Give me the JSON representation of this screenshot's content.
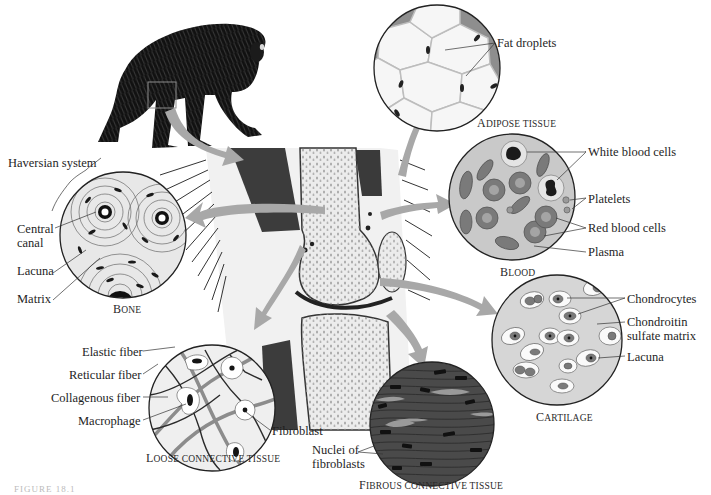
{
  "figure": {
    "caption_partial": "FIGURE 18.1"
  },
  "panels": {
    "bone": {
      "caption": "Bone",
      "labels": [
        "Haversian system",
        "Central canal",
        "Lacuna",
        "Matrix"
      ]
    },
    "adipose": {
      "caption": "Adipose tissue",
      "labels": [
        "Fat droplets"
      ]
    },
    "blood": {
      "caption": "Blood",
      "labels": [
        "White blood cells",
        "Platelets",
        "Red blood cells",
        "Plasma"
      ]
    },
    "cartilage": {
      "caption": "Cartilage",
      "labels": [
        "Chondrocytes",
        "Chondroitin",
        "sulfate matrix",
        "Lacuna"
      ]
    },
    "loose": {
      "caption": "Loose connective tissue",
      "labels": [
        "Elastic fiber",
        "Reticular fiber",
        "Collagenous fiber",
        "Macrophage",
        "Fibroblast"
      ]
    },
    "fibrous": {
      "caption": "Fibrous connective tissue",
      "labels": [
        "Nuclei of",
        "fibroblasts"
      ]
    }
  },
  "colors": {
    "arrow": "#a8a8a8",
    "ink": "#1e1e1e",
    "bone_fill": "#e8e8e8",
    "blood_fill": "#c9c9c9",
    "rbc": "#7a7a7a",
    "cartilage_fill": "#d6d6d6",
    "fibrous_fill": "#4a4a4a",
    "adipose_wall": "#8e8e8e"
  }
}
